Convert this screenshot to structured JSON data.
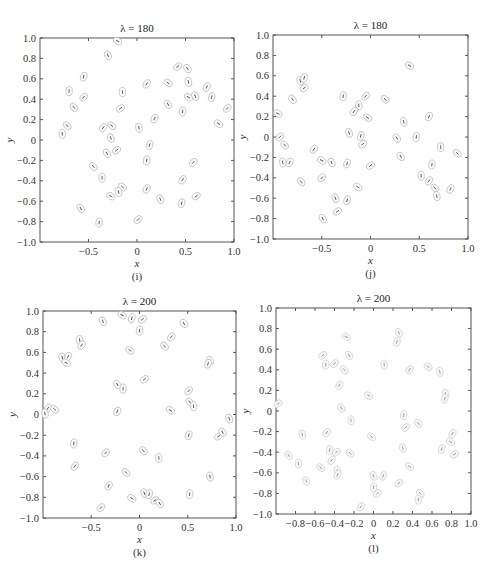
{
  "chart_data": [
    {
      "id": "i",
      "type": "scatter",
      "title": "λ = 180",
      "caption": "(i)",
      "xlabel": "x",
      "ylabel": "y",
      "xlim": [
        -1.0,
        1.0
      ],
      "ylim": [
        -1.0,
        1.0
      ],
      "xticks": [
        -0.5,
        0,
        0.5,
        1.0
      ],
      "xtick_labels": [
        "−0.5",
        "0",
        "0.5",
        "1.0"
      ],
      "yticks": [
        -1.0,
        -0.8,
        -0.6,
        -0.4,
        -0.2,
        0,
        0.2,
        0.4,
        0.6,
        0.8,
        1.0
      ],
      "ytick_labels": [
        "−1.0",
        "−0.8",
        "−0.6",
        "−0.4",
        "−0.2",
        "0",
        "0.2",
        "0.4",
        "0.6",
        "0.8",
        "1.0"
      ],
      "grid": false,
      "legend": null,
      "marker": "ellipse with inner dash",
      "frame_px": {
        "left": 40,
        "top": 38,
        "right": 234,
        "bottom": 242
      },
      "points": [
        [
          -0.2,
          0.97
        ],
        [
          -0.3,
          0.83
        ],
        [
          -0.55,
          0.62
        ],
        [
          0.42,
          0.72
        ],
        [
          0.52,
          0.7
        ],
        [
          -0.7,
          0.48
        ],
        [
          -0.55,
          0.42
        ],
        [
          -0.65,
          0.32
        ],
        [
          -0.15,
          0.47
        ],
        [
          0.1,
          0.55
        ],
        [
          0.32,
          0.56
        ],
        [
          0.53,
          0.57
        ],
        [
          0.72,
          0.52
        ],
        [
          0.53,
          0.42
        ],
        [
          0.6,
          0.43
        ],
        [
          0.77,
          0.42
        ],
        [
          -0.17,
          0.31
        ],
        [
          0.32,
          0.35
        ],
        [
          0.47,
          0.28
        ],
        [
          0.93,
          0.31
        ],
        [
          -0.72,
          0.14
        ],
        [
          -0.77,
          0.06
        ],
        [
          -0.35,
          0.12
        ],
        [
          -0.26,
          0.14
        ],
        [
          0.02,
          0.12
        ],
        [
          0.18,
          0.21
        ],
        [
          0.84,
          0.16
        ],
        [
          -0.27,
          0.02
        ],
        [
          0.13,
          -0.05
        ],
        [
          -0.21,
          -0.1
        ],
        [
          -0.31,
          -0.13
        ],
        [
          0.1,
          -0.2
        ],
        [
          0.58,
          -0.22
        ],
        [
          -0.45,
          -0.26
        ],
        [
          -0.36,
          -0.37
        ],
        [
          0.47,
          -0.39
        ],
        [
          -0.15,
          -0.46
        ],
        [
          -0.19,
          -0.51
        ],
        [
          0.1,
          -0.48
        ],
        [
          -0.27,
          -0.55
        ],
        [
          0.24,
          -0.58
        ],
        [
          0.46,
          -0.62
        ],
        [
          0.61,
          -0.55
        ],
        [
          -0.58,
          -0.67
        ],
        [
          -0.39,
          -0.81
        ],
        [
          0.01,
          -0.78
        ]
      ]
    },
    {
      "id": "j",
      "type": "scatter",
      "title": "λ = 180",
      "caption": "(j)",
      "xlabel": "x",
      "ylabel": "y",
      "xlim": [
        -1.0,
        1.0
      ],
      "ylim": [
        -1.0,
        1.0
      ],
      "xticks": [
        -0.5,
        0,
        0.5,
        1.0
      ],
      "xtick_labels": [
        "−0.5",
        "0",
        "0.5",
        "1.0"
      ],
      "yticks": [
        -1.0,
        -0.8,
        -0.6,
        -0.4,
        -0.2,
        0,
        0.2,
        0.4,
        0.6,
        0.8,
        1.0
      ],
      "ytick_labels": [
        "−1.0",
        "−0.8",
        "−0.6",
        "−0.4",
        "−0.2",
        "0",
        "0.2",
        "0.4",
        "0.6",
        "0.8",
        "1.0"
      ],
      "grid": false,
      "legend": null,
      "marker": "ellipse with inner dash",
      "frame_px": {
        "left": 273,
        "top": 35,
        "right": 468,
        "bottom": 239
      },
      "points": [
        [
          0.4,
          0.7
        ],
        [
          -0.72,
          0.55
        ],
        [
          -0.68,
          0.58
        ],
        [
          -0.68,
          0.48
        ],
        [
          -0.8,
          0.37
        ],
        [
          -0.28,
          0.4
        ],
        [
          -0.05,
          0.4
        ],
        [
          0.15,
          0.37
        ],
        [
          -0.12,
          0.31
        ],
        [
          -0.17,
          0.25
        ],
        [
          -0.03,
          0.19
        ],
        [
          0.34,
          0.15
        ],
        [
          0.6,
          0.2
        ],
        [
          -0.95,
          0.23
        ],
        [
          -0.22,
          0.04
        ],
        [
          -0.1,
          0.01
        ],
        [
          -0.08,
          -0.07
        ],
        [
          0.27,
          -0.01
        ],
        [
          0.47,
          0.0
        ],
        [
          -0.93,
          0.0
        ],
        [
          -0.88,
          -0.08
        ],
        [
          0.72,
          -0.1
        ],
        [
          -0.58,
          -0.12
        ],
        [
          0.89,
          -0.16
        ],
        [
          -0.9,
          -0.25
        ],
        [
          -0.83,
          -0.25
        ],
        [
          -0.5,
          -0.23
        ],
        [
          -0.4,
          -0.25
        ],
        [
          -0.24,
          -0.26
        ],
        [
          0.0,
          -0.28
        ],
        [
          0.31,
          -0.19
        ],
        [
          0.63,
          -0.27
        ],
        [
          -0.5,
          -0.4
        ],
        [
          -0.71,
          -0.44
        ],
        [
          0.52,
          -0.38
        ],
        [
          0.6,
          -0.43
        ],
        [
          0.66,
          -0.5
        ],
        [
          0.68,
          -0.58
        ],
        [
          0.82,
          -0.51
        ],
        [
          -0.13,
          -0.49
        ],
        [
          -0.36,
          -0.6
        ],
        [
          -0.24,
          -0.62
        ],
        [
          -0.34,
          -0.73
        ],
        [
          -0.49,
          -0.8
        ]
      ]
    },
    {
      "id": "k",
      "type": "scatter",
      "title": "λ = 200",
      "caption": "(k)",
      "xlabel": "x",
      "ylabel": "y",
      "xlim": [
        -1.0,
        1.0
      ],
      "ylim": [
        -1.0,
        1.0
      ],
      "xticks": [
        -0.5,
        0,
        0.5,
        1.0
      ],
      "xtick_labels": [
        "−0.5",
        "0",
        "0.5",
        "1.0"
      ],
      "yticks": [
        -1.0,
        -0.8,
        -0.6,
        -0.4,
        -0.2,
        0,
        0.2,
        0.4,
        0.6,
        0.8,
        1.0
      ],
      "ytick_labels": [
        "−1.0",
        "−0.8",
        "−0.6",
        "−0.4",
        "−0.2",
        "0",
        "0.2",
        "0.4",
        "0.6",
        "0.8",
        "1.0"
      ],
      "grid": false,
      "legend": null,
      "marker": "ellipse with inner dash",
      "frame_px": {
        "left": 43,
        "top": 311,
        "right": 236,
        "bottom": 518
      },
      "points": [
        [
          -0.18,
          0.96
        ],
        [
          -0.38,
          0.9
        ],
        [
          -0.08,
          0.93
        ],
        [
          0.03,
          0.92
        ],
        [
          0.46,
          0.88
        ],
        [
          0.0,
          0.81
        ],
        [
          0.33,
          0.75
        ],
        [
          0.26,
          0.66
        ],
        [
          -0.62,
          0.72
        ],
        [
          -0.6,
          0.67
        ],
        [
          -0.1,
          0.62
        ],
        [
          -0.8,
          0.55
        ],
        [
          -0.74,
          0.56
        ],
        [
          -0.76,
          0.5
        ],
        [
          0.73,
          0.52
        ],
        [
          0.71,
          0.49
        ],
        [
          0.05,
          0.34
        ],
        [
          -0.23,
          0.29
        ],
        [
          -0.17,
          0.25
        ],
        [
          0.51,
          0.23
        ],
        [
          0.52,
          0.12
        ],
        [
          0.56,
          0.08
        ],
        [
          -0.95,
          0.06
        ],
        [
          -0.88,
          0.05
        ],
        [
          -0.98,
          0.01
        ],
        [
          -0.23,
          0.03
        ],
        [
          0.32,
          0.04
        ],
        [
          0.93,
          -0.04
        ],
        [
          0.51,
          -0.2
        ],
        [
          0.82,
          -0.21
        ],
        [
          0.86,
          -0.17
        ],
        [
          -0.68,
          -0.28
        ],
        [
          -0.35,
          -0.37
        ],
        [
          0.04,
          -0.35
        ],
        [
          0.2,
          -0.42
        ],
        [
          -0.67,
          -0.5
        ],
        [
          -0.14,
          -0.56
        ],
        [
          0.73,
          -0.6
        ],
        [
          -0.32,
          -0.69
        ],
        [
          -0.08,
          -0.81
        ],
        [
          0.05,
          -0.76
        ],
        [
          0.1,
          -0.77
        ],
        [
          0.16,
          -0.83
        ],
        [
          0.21,
          -0.86
        ],
        [
          0.52,
          -0.77
        ],
        [
          -0.4,
          -0.9
        ]
      ]
    },
    {
      "id": "l",
      "type": "scatter",
      "title": "λ = 200",
      "caption": "(l)",
      "xlabel": "x",
      "ylabel": "y",
      "xlim": [
        -1.0,
        1.0
      ],
      "ylim": [
        -1.0,
        1.0
      ],
      "xticks": [
        -0.8,
        -0.6,
        -0.4,
        -0.2,
        0,
        0.2,
        0.4,
        0.6,
        0.8,
        1.0
      ],
      "xtick_labels": [
        "−0.8",
        "−0.6",
        "−0.4",
        "−0.2",
        "0",
        "0.2",
        "0.4",
        "0.6",
        "0.8",
        "1.0"
      ],
      "yticks": [
        -1.0,
        -0.8,
        -0.6,
        -0.4,
        -0.2,
        0,
        0.2,
        0.4,
        0.6,
        0.8,
        1.0
      ],
      "ytick_labels": [
        "−1.0",
        "−0.8",
        "−0.6",
        "−0.4",
        "−0.2",
        "0",
        "0.2",
        "0.4",
        "0.6",
        "0.8",
        "1.0"
      ],
      "grid": false,
      "legend": null,
      "marker": "ellipse with inner dash (faint)",
      "frame_px": {
        "left": 276,
        "top": 308,
        "right": 471,
        "bottom": 514
      },
      "points": [
        [
          -0.28,
          0.72
        ],
        [
          0.26,
          0.76
        ],
        [
          0.24,
          0.67
        ],
        [
          -0.52,
          0.54
        ],
        [
          -0.25,
          0.54
        ],
        [
          -0.49,
          0.45
        ],
        [
          -0.4,
          0.46
        ],
        [
          -0.3,
          0.4
        ],
        [
          0.11,
          0.45
        ],
        [
          0.37,
          0.4
        ],
        [
          0.56,
          0.43
        ],
        [
          0.68,
          0.38
        ],
        [
          -0.35,
          0.25
        ],
        [
          -0.05,
          0.15
        ],
        [
          0.74,
          0.17
        ],
        [
          0.73,
          0.12
        ],
        [
          -0.98,
          0.07
        ],
        [
          -0.33,
          0.03
        ],
        [
          0.31,
          -0.04
        ],
        [
          0.33,
          -0.16
        ],
        [
          0.46,
          -0.12
        ],
        [
          -0.23,
          -0.09
        ],
        [
          -0.48,
          -0.21
        ],
        [
          -0.02,
          -0.25
        ],
        [
          -0.73,
          -0.23
        ],
        [
          0.81,
          -0.22
        ],
        [
          0.79,
          -0.3
        ],
        [
          0.3,
          -0.36
        ],
        [
          0.7,
          -0.37
        ],
        [
          0.83,
          -0.42
        ],
        [
          -0.87,
          -0.43
        ],
        [
          -0.45,
          -0.38
        ],
        [
          -0.38,
          -0.4
        ],
        [
          -0.24,
          -0.41
        ],
        [
          -0.77,
          -0.51
        ],
        [
          -0.43,
          -0.48
        ],
        [
          -0.54,
          -0.55
        ],
        [
          -0.37,
          -0.58
        ],
        [
          -0.37,
          -0.62
        ],
        [
          0.37,
          -0.54
        ],
        [
          0.0,
          -0.63
        ],
        [
          0.1,
          -0.63
        ],
        [
          0.26,
          -0.7
        ],
        [
          -0.69,
          -0.68
        ],
        [
          0.0,
          -0.74
        ],
        [
          0.04,
          -0.8
        ],
        [
          0.48,
          -0.8
        ],
        [
          0.46,
          -0.86
        ],
        [
          -0.13,
          -0.93
        ]
      ]
    }
  ]
}
